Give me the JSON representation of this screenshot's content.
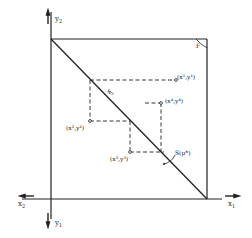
{
  "diagram": {
    "type": "Edgeworth-style box with feasibility diagonal and price-adjustment path",
    "axes": {
      "y2_label": "y",
      "y2_sub": "2",
      "y1_label": "y",
      "y1_sub": "1",
      "x1_label": "x",
      "x1_sub": "1",
      "x2_label": "x",
      "x2_sub": "2"
    },
    "corner_label": "F",
    "diagonal_label": "S(μ*)",
    "diagonal_tag": "wʸ",
    "points": [
      {
        "id": "p1",
        "label": "(x¹,y¹)"
      },
      {
        "id": "p2",
        "label": "(x²,y²)"
      },
      {
        "id": "p3",
        "label": "(x³,y³)"
      },
      {
        "id": "p4",
        "label": "(x⁴,y⁴)"
      }
    ],
    "colors": {
      "ink": "#222222",
      "background": "#ffffff"
    }
  }
}
